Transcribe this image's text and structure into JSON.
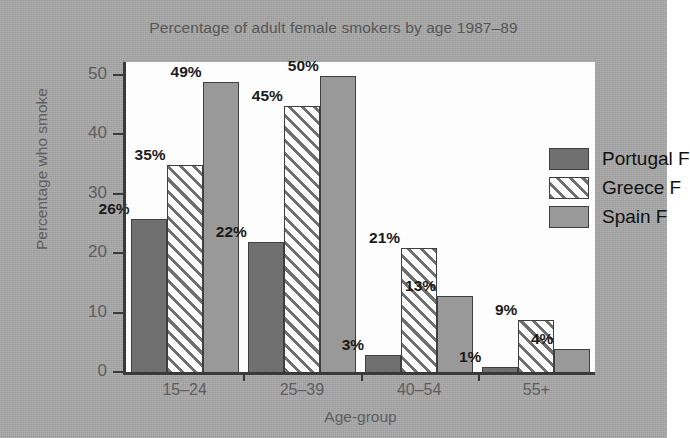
{
  "chart_data": {
    "type": "bar",
    "title": "Percentage of adult female smokers by age 1987–89",
    "xlabel": "Age-group",
    "ylabel": "Percentage who smoke",
    "categories": [
      "15–24",
      "25–39",
      "40–54",
      "55+"
    ],
    "series": [
      {
        "name": "Portugal F",
        "values": [
          26,
          22,
          3,
          1
        ],
        "color": "#707070",
        "fill": "solid-dark-grey"
      },
      {
        "name": "Greece F",
        "values": [
          35,
          45,
          21,
          9
        ],
        "color": "#fbfbfb",
        "fill": "diagonal-hatch"
      },
      {
        "name": "Spain F",
        "values": [
          49,
          50,
          13,
          4
        ],
        "color": "#999999",
        "fill": "solid-medium-grey"
      }
    ],
    "data_labels": [
      [
        "26%",
        "22%",
        "3%",
        "1%"
      ],
      [
        "35%",
        "45%",
        "21%",
        "9%"
      ],
      [
        "49%",
        "50%",
        "13%",
        "4%"
      ]
    ],
    "ylim": [
      0,
      50
    ],
    "yticks": [
      0,
      10,
      20,
      30,
      40,
      50
    ],
    "ytick_labels": [
      "0",
      "10",
      "20",
      "30",
      "40",
      "50"
    ],
    "grid": false,
    "legend_position": "upper-right-inside",
    "value_suffix": "%"
  },
  "figure": {
    "background_color": "#a9a9a9",
    "plot_background_color": "#fdfdfd",
    "axis_color": "#3a3a3a",
    "title_color": "#575757"
  }
}
